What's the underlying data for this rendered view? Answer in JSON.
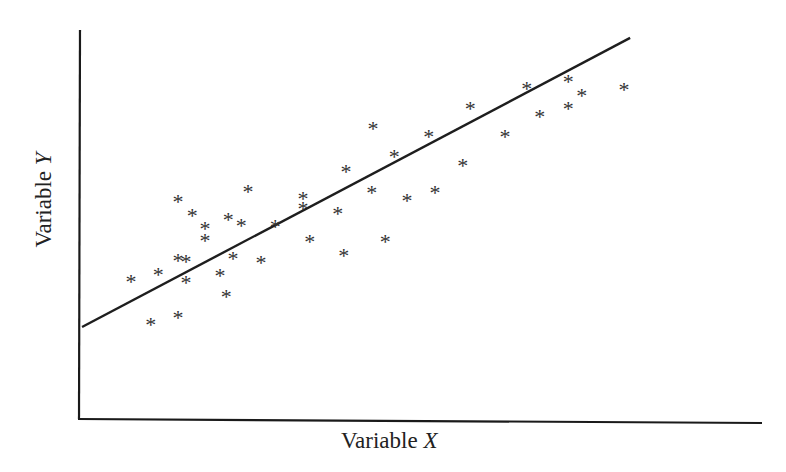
{
  "chart_data": {
    "type": "scatter",
    "title": "",
    "xlabel": "Variable X",
    "ylabel": "Variable Y",
    "xlabel_parts": {
      "text": "Variable ",
      "var": "X"
    },
    "ylabel_parts": {
      "text": "Variable ",
      "var": "Y"
    },
    "xlim": [
      0,
      100
    ],
    "ylim": [
      0,
      100
    ],
    "ticks": "none",
    "grid": false,
    "legend": null,
    "marker": "*",
    "points": [
      {
        "x": 7.5,
        "y": 37.2
      },
      {
        "x": 11.5,
        "y": 39.0
      },
      {
        "x": 10.4,
        "y": 26.3
      },
      {
        "x": 14.4,
        "y": 28.1
      },
      {
        "x": 14.4,
        "y": 57.5
      },
      {
        "x": 16.5,
        "y": 53.9
      },
      {
        "x": 14.4,
        "y": 42.5
      },
      {
        "x": 15.6,
        "y": 42.3
      },
      {
        "x": 15.6,
        "y": 36.9
      },
      {
        "x": 18.4,
        "y": 50.6
      },
      {
        "x": 18.4,
        "y": 47.6
      },
      {
        "x": 20.6,
        "y": 38.7
      },
      {
        "x": 21.8,
        "y": 52.9
      },
      {
        "x": 21.5,
        "y": 33.4
      },
      {
        "x": 22.5,
        "y": 43.0
      },
      {
        "x": 23.7,
        "y": 51.4
      },
      {
        "x": 24.7,
        "y": 60.0
      },
      {
        "x": 26.6,
        "y": 42.0
      },
      {
        "x": 28.7,
        "y": 51.1
      },
      {
        "x": 32.8,
        "y": 58.2
      },
      {
        "x": 32.8,
        "y": 55.7
      },
      {
        "x": 33.8,
        "y": 47.3
      },
      {
        "x": 37.9,
        "y": 54.4
      },
      {
        "x": 38.8,
        "y": 43.8
      },
      {
        "x": 39.1,
        "y": 65.1
      },
      {
        "x": 42.9,
        "y": 59.7
      },
      {
        "x": 43.1,
        "y": 75.9
      },
      {
        "x": 44.9,
        "y": 47.3
      },
      {
        "x": 46.2,
        "y": 68.9
      },
      {
        "x": 48.1,
        "y": 57.7
      },
      {
        "x": 51.3,
        "y": 73.9
      },
      {
        "x": 52.2,
        "y": 59.7
      },
      {
        "x": 56.3,
        "y": 66.6
      },
      {
        "x": 57.4,
        "y": 81.0
      },
      {
        "x": 62.5,
        "y": 73.9
      },
      {
        "x": 65.7,
        "y": 86.1
      },
      {
        "x": 67.6,
        "y": 79.0
      },
      {
        "x": 71.8,
        "y": 87.8
      },
      {
        "x": 71.8,
        "y": 81.0
      },
      {
        "x": 73.8,
        "y": 84.3
      },
      {
        "x": 80.0,
        "y": 85.8
      }
    ],
    "regression_line": {
      "x0": 0.3,
      "y0": 24.8,
      "x1": 80.9,
      "y1": 98.0
    },
    "plot_px": {
      "x0": 80,
      "x1": 760,
      "y0": 425,
      "y1": 30
    }
  }
}
